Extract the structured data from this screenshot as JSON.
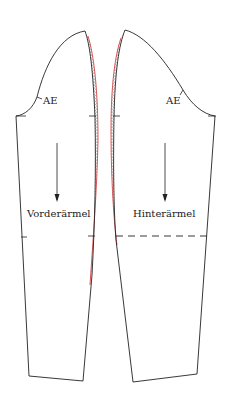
{
  "diagram": {
    "type": "sewing-pattern",
    "pieces": [
      {
        "id": "front",
        "label": "Vorderärmel",
        "notch_label": "AE"
      },
      {
        "id": "back",
        "label": "Hinterärmel",
        "notch_label": "AE"
      }
    ],
    "colors": {
      "outline": "#222222",
      "seam_allowance": "#d03030",
      "hatch": "#333333"
    }
  }
}
